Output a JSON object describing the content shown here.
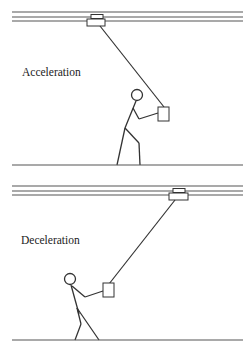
{
  "panels": [
    {
      "id": "acceleration",
      "label": "Acceleration",
      "stroke_color": "#333333",
      "trolley_position": "left",
      "person_position": "right of label, behind load",
      "posture": "leaning back, holding load"
    },
    {
      "id": "deceleration",
      "label": "Deceleration",
      "stroke_color": "#333333",
      "trolley_position": "right",
      "person_position": "left, ahead of load",
      "posture": "leaning forward, bracing load"
    }
  ]
}
